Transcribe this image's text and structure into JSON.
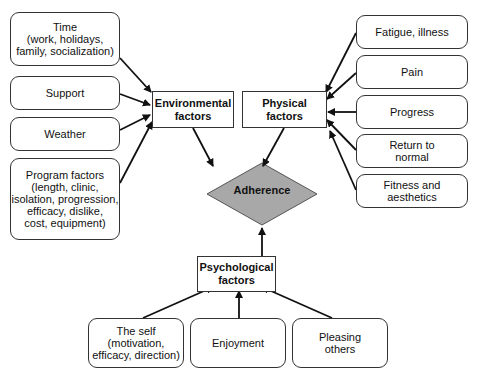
{
  "diagram": {
    "center": {
      "label": "Adherence",
      "fill": "#a8a8a8"
    },
    "categories": {
      "environmental": "Environmental\nfactors",
      "physical": "Physical\nfactors",
      "psychological": "Psychological\nfactors"
    },
    "environmental_items": [
      "Time\n(work, holidays,\nfamily, socialization)",
      "Support",
      "Weather",
      "Program factors\n(length, clinic,\nisolation, progression,\nefficacy, dislike,\ncost, equipment)"
    ],
    "physical_items": [
      "Fatigue, illness",
      "Pain",
      "Progress",
      "Return to\nnormal",
      "Fitness and\naesthetics"
    ],
    "psychological_items": [
      "The self\n(motivation,\nefficacy, direction)",
      "Enjoyment",
      "Pleasing\nothers"
    ]
  }
}
